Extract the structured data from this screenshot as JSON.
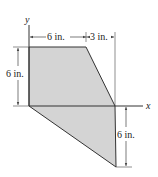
{
  "diagram": {
    "type": "composite-area-cross-section",
    "axes": {
      "x_label": "x",
      "y_label": "y"
    },
    "dimensions": {
      "top_width": "6 in.",
      "top_offset": "3 in.",
      "left_height": "6 in.",
      "right_height": "6 in."
    },
    "colors": {
      "fill": "#d4d4d4",
      "stroke": "#333333",
      "dimension": "#444444"
    }
  }
}
